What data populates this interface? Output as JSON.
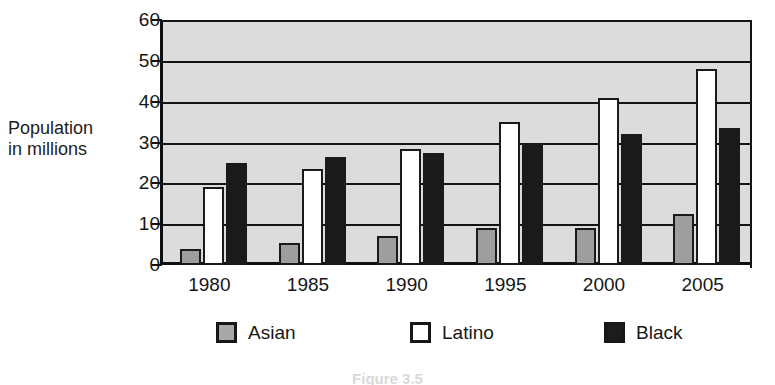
{
  "chart_data": {
    "type": "bar",
    "title": "",
    "xlabel": "",
    "ylabel": "Population in millions",
    "ylabel_lines": [
      "Population",
      "in millions"
    ],
    "categories": [
      "1980",
      "1985",
      "1990",
      "1995",
      "2000",
      "2005"
    ],
    "series": [
      {
        "name": "Asian",
        "color": "#9e9e9e",
        "values": [
          4,
          5.5,
          7,
          9,
          9,
          12.5
        ]
      },
      {
        "name": "Latino",
        "color": "#ffffff",
        "values": [
          19,
          23.5,
          28.5,
          35,
          41,
          48
        ]
      },
      {
        "name": "Black",
        "color": "#1a1a1a",
        "values": [
          25,
          26.5,
          27.5,
          30,
          32,
          33.5
        ]
      }
    ],
    "ylim": [
      0,
      60
    ],
    "ytick_values": [
      0,
      10,
      20,
      30,
      40,
      50,
      60
    ],
    "ytick_labels": [
      "0",
      "10",
      "20",
      "30",
      "40",
      "50",
      "60"
    ],
    "grid": true,
    "grid_axis": "y",
    "legend_position": "bottom",
    "plot_background": "#dcdcdc",
    "axis_color": "#141414"
  },
  "legend": {
    "items": [
      {
        "label": "Asian",
        "swatch": "asian"
      },
      {
        "label": "Latino",
        "swatch": "latino"
      },
      {
        "label": "Black",
        "swatch": "black"
      }
    ]
  },
  "caption": {
    "text": "Figure 3.5"
  }
}
